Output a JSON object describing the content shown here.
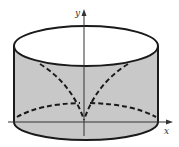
{
  "diagram": {
    "type": "cylinder-with-cusp-curves",
    "axes": {
      "x_label": "x",
      "y_label": "y"
    },
    "colors": {
      "fill": "#c8c8c8",
      "stroke": "#1a1a1a",
      "axis": "#333333",
      "top_face": "#ffffff"
    },
    "elements": [
      "cylinder outline with shaded lateral surface",
      "elliptical top face (unshaded)",
      "dashed cusp curves meeting at origin on y-axis",
      "dashed back elliptical arc of base",
      "x-axis arrow",
      "y-axis arrow"
    ]
  }
}
